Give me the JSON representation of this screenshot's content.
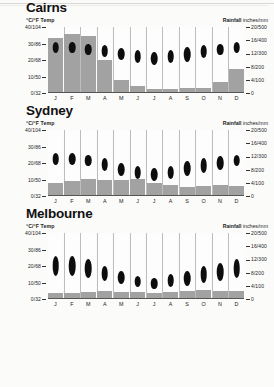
{
  "document": {
    "type": "climate-chart-sheet",
    "axis": {
      "left_label_units": "°C/°F",
      "left_label_name": "Temp",
      "right_label_name": "Rainfall",
      "right_label_units": "inches/mm",
      "temp_ticks": [
        "40/104",
        "30/86",
        "20/68",
        "10/50",
        "0/32"
      ],
      "rain_ticks": [
        "20/500",
        "16/400",
        "12/300",
        "8/200",
        "4/100",
        "0"
      ],
      "temp_min_c": 0,
      "temp_max_c": 40,
      "rain_min_mm": 0,
      "rain_max_mm": 500
    },
    "months": [
      "J",
      "F",
      "M",
      "A",
      "M",
      "J",
      "J",
      "A",
      "S",
      "O",
      "N",
      "D"
    ],
    "colors": {
      "bar": "#a2a2a2",
      "oval": "#0d0d0d",
      "grid": "#bdbdbd",
      "background": "#fbfbfa",
      "text": "#1a1a1a"
    }
  },
  "chart_data": [
    {
      "type": "bar",
      "title": "Cairns",
      "xlabel": "",
      "ylabel": "°C/°F Temp",
      "y2label": "Rainfall inches/mm",
      "ylim": [
        0,
        40
      ],
      "y2lim": [
        0,
        500
      ],
      "categories": [
        "J",
        "F",
        "M",
        "A",
        "M",
        "J",
        "J",
        "A",
        "S",
        "O",
        "N",
        "D"
      ],
      "series": [
        {
          "name": "Rainfall (mm)",
          "kind": "bar",
          "values": [
            420,
            450,
            430,
            250,
            100,
            55,
            30,
            30,
            35,
            38,
            85,
            180
          ]
        },
        {
          "name": "Temperature range (°C)",
          "kind": "range",
          "min": [
            24,
            24,
            23,
            22,
            20,
            18,
            17,
            18,
            19,
            21,
            23,
            24
          ],
          "max": [
            31,
            31,
            30,
            29,
            27,
            26,
            25,
            26,
            28,
            29,
            30,
            31
          ]
        }
      ]
    },
    {
      "type": "bar",
      "title": "Sydney",
      "xlabel": "",
      "ylabel": "°C/°F Temp",
      "y2label": "Rainfall inches/mm",
      "ylim": [
        0,
        40
      ],
      "y2lim": [
        0,
        500
      ],
      "categories": [
        "J",
        "F",
        "M",
        "A",
        "M",
        "J",
        "J",
        "A",
        "S",
        "O",
        "N",
        "D"
      ],
      "series": [
        {
          "name": "Rainfall (mm)",
          "kind": "bar",
          "values": [
            100,
            110,
            130,
            125,
            120,
            130,
            95,
            80,
            70,
            75,
            80,
            75
          ]
        },
        {
          "name": "Temperature range (°C)",
          "kind": "range",
          "min": [
            19,
            19,
            18,
            15,
            12,
            10,
            9,
            10,
            12,
            14,
            16,
            18
          ],
          "max": [
            26,
            26,
            25,
            23,
            20,
            18,
            17,
            18,
            21,
            23,
            24,
            25
          ]
        }
      ]
    },
    {
      "type": "bar",
      "title": "Melbourne",
      "xlabel": "",
      "ylabel": "°C/°F Temp",
      "y2label": "Rainfall inches/mm",
      "ylim": [
        0,
        40
      ],
      "y2lim": [
        0,
        500
      ],
      "categories": [
        "J",
        "F",
        "M",
        "A",
        "M",
        "J",
        "J",
        "A",
        "S",
        "O",
        "N",
        "D"
      ],
      "series": [
        {
          "name": "Rainfall (mm)",
          "kind": "bar",
          "values": [
            48,
            48,
            52,
            58,
            56,
            50,
            48,
            50,
            58,
            66,
            60,
            58
          ]
        },
        {
          "name": "Temperature range (°C)",
          "kind": "range",
          "min": [
            14,
            14,
            13,
            11,
            9,
            7,
            6,
            7,
            8,
            10,
            11,
            13
          ],
          "max": [
            26,
            26,
            24,
            20,
            17,
            14,
            13,
            15,
            17,
            20,
            22,
            24
          ]
        }
      ]
    }
  ]
}
